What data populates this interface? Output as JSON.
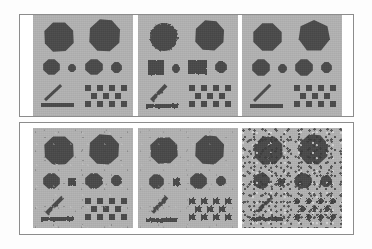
{
  "figure": {
    "title": "",
    "panel_background_color": "#b2b2b2",
    "shape_color": "#4a4a4a",
    "frame_color": "#8c8c8c",
    "page_color": "#ffffff",
    "rows": 2,
    "columns": 3,
    "total_panels": 6
  },
  "panels": [
    {
      "id": "panel-top-left",
      "row": 1,
      "column": 1,
      "degradation": "none",
      "noise_level": 0,
      "caption": ""
    },
    {
      "id": "panel-top-center",
      "row": 1,
      "column": 2,
      "degradation": "none",
      "noise_level": 0,
      "caption": ""
    },
    {
      "id": "panel-top-right",
      "row": 1,
      "column": 3,
      "degradation": "none",
      "noise_level": 0,
      "caption": ""
    },
    {
      "id": "panel-bottom-left",
      "row": 2,
      "column": 1,
      "degradation": "edge-erosion",
      "noise_level": 1,
      "caption": ""
    },
    {
      "id": "panel-bottom-center",
      "row": 2,
      "column": 2,
      "degradation": "edge-erosion",
      "noise_level": 1,
      "caption": ""
    },
    {
      "id": "panel-bottom-right",
      "row": 2,
      "column": 3,
      "degradation": "salt-and-pepper",
      "noise_level": 2,
      "caption": ""
    }
  ],
  "pattern_elements": {
    "large_shapes": [
      {
        "name": "large-blob-left",
        "type": "polygon",
        "position": "top-left"
      },
      {
        "name": "large-blob-right",
        "type": "polygon",
        "position": "top-right"
      }
    ],
    "medium_shapes": [
      {
        "name": "medium-shape-1",
        "type": "octagon",
        "size": "medium"
      },
      {
        "name": "medium-shape-2",
        "type": "octagon",
        "size": "small"
      },
      {
        "name": "medium-shape-3",
        "type": "octagon",
        "size": "medium"
      },
      {
        "name": "medium-shape-4",
        "type": "octagon",
        "size": "small"
      }
    ],
    "line_elements": [
      {
        "name": "diagonal-line",
        "orientation": "diagonal-45"
      },
      {
        "name": "horizontal-bar",
        "orientation": "horizontal"
      }
    ],
    "checkerboard": {
      "name": "checkerboard-pattern",
      "rows": 3,
      "columns": 7,
      "cell_size_px": 6
    }
  }
}
